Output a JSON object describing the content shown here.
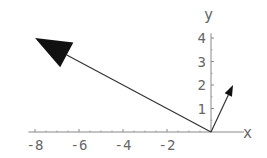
{
  "chart_data": {
    "type": "line",
    "title": "",
    "xlabel": "x",
    "ylabel": "y",
    "xlim": [
      -8.3,
      1.5
    ],
    "ylim": [
      0,
      4.2
    ],
    "x_ticks": [
      -8,
      -6,
      -4,
      -2
    ],
    "y_ticks": [
      1,
      2,
      3,
      4
    ],
    "x_tick_labels": [
      "-8",
      "-6",
      "-4",
      "-2"
    ],
    "y_tick_labels": [
      "1",
      "2",
      "3",
      "4"
    ],
    "grid": false,
    "series": [
      {
        "name": "vector-large",
        "from": [
          0,
          0
        ],
        "to": [
          -8,
          4
        ],
        "head": "large"
      },
      {
        "name": "vector-small",
        "from": [
          0,
          0
        ],
        "to": [
          1,
          2
        ],
        "head": "small"
      }
    ]
  },
  "axes": {
    "x_label": "x",
    "y_label": "y"
  },
  "colors": {
    "axis": "#888888",
    "arrow": "#333333",
    "text": "#666666"
  }
}
